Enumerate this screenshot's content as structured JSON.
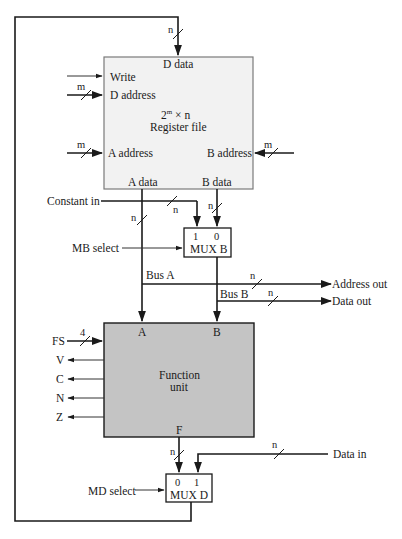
{
  "colors": {
    "register_file_fill": "#f2f2f2",
    "register_file_stroke": "#7a7a7a",
    "function_unit_fill": "#c4c4c4",
    "line": "#1a1a1a",
    "background": "#ffffff"
  },
  "register_file": {
    "title_line1": "2",
    "title_sup": "m",
    "title_line1_rest": " × n",
    "title_line2": "Register file",
    "ports": {
      "d_data": "D data",
      "write": "Write",
      "d_address": "D address",
      "a_address": "A address",
      "b_address": "B address",
      "a_data": "A data",
      "b_data": "B data"
    },
    "bus_widths": {
      "d_data": "n",
      "d_address": "m",
      "a_address": "m",
      "b_address": "m"
    }
  },
  "mux_b": {
    "label": "MUX B",
    "input_1": "1",
    "input_0": "0",
    "select": "MB select"
  },
  "constant_in": {
    "label": "Constant in",
    "width": "n"
  },
  "a_data_width": "n",
  "b_data_width": "n",
  "bus_a": {
    "label": "Bus A",
    "out_label": "Address out",
    "width": "n"
  },
  "bus_b": {
    "label": "Bus B",
    "out_label": "Data out",
    "width": "n"
  },
  "function_unit": {
    "title_line1": "Function",
    "title_line2": "unit",
    "port_a": "A",
    "port_b": "B",
    "port_f": "F",
    "fs": {
      "label": "FS",
      "width": "4"
    },
    "flags": [
      "V",
      "C",
      "N",
      "Z"
    ]
  },
  "f_width": "n",
  "data_in": {
    "label": "Data in",
    "width": "n"
  },
  "mux_d": {
    "label": "MUX D",
    "input_0": "0",
    "input_1": "1",
    "select": "MD select"
  }
}
